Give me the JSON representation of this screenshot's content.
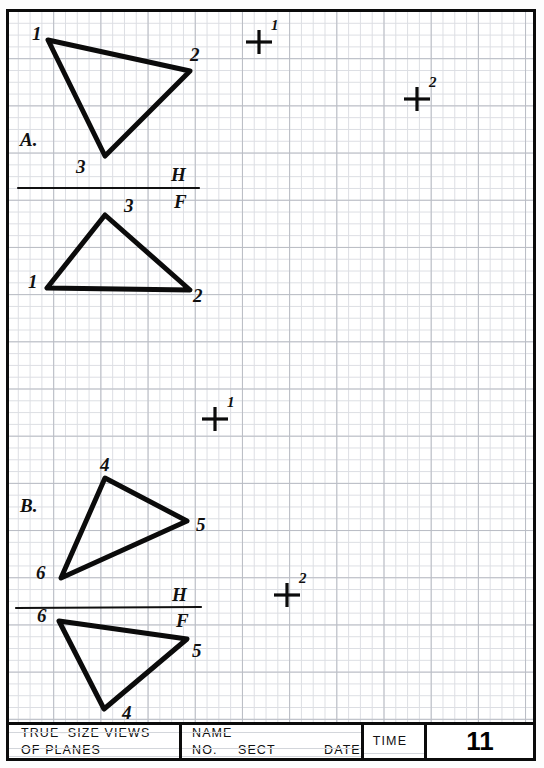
{
  "sheet": {
    "width": 544,
    "height": 768,
    "grid": {
      "minor_spacing_px": 11.8,
      "major_spacing_px": 47.2,
      "minor_color": "#dcdee3",
      "major_color": "#b9bcc4"
    },
    "ink_color": "#0b0b0b"
  },
  "problems": [
    {
      "id": "A",
      "section_label": "A.",
      "section_label_pos": {
        "x": 20,
        "y": 130
      },
      "top_view": {
        "name": "triangle-a-top-view",
        "points": [
          [
            48,
            40
          ],
          [
            190,
            71
          ],
          [
            105,
            156
          ]
        ],
        "vertex_labels": [
          {
            "text": "1",
            "x": 32,
            "y": 24
          },
          {
            "text": "2",
            "x": 190,
            "y": 45
          },
          {
            "text": "3",
            "x": 76,
            "y": 157
          }
        ]
      },
      "fold_line": {
        "name": "fold-line-a",
        "x1": 18,
        "y1": 188,
        "x2": 199,
        "y2": 188,
        "upper_label": {
          "text": "H",
          "x": 171,
          "y": 165
        },
        "lower_label": {
          "text": "F",
          "x": 174,
          "y": 192
        }
      },
      "front_view": {
        "name": "triangle-a-front-view",
        "points": [
          [
            105,
            215
          ],
          [
            47,
            288
          ],
          [
            190,
            290
          ]
        ],
        "vertex_labels": [
          {
            "text": "3",
            "x": 124,
            "y": 196
          },
          {
            "text": "1",
            "x": 28,
            "y": 272
          },
          {
            "text": "2",
            "x": 193,
            "y": 286
          }
        ]
      },
      "target_points": [
        {
          "name": "target-point-1",
          "text": "1",
          "x": 259,
          "y": 42
        },
        {
          "name": "target-point-2",
          "text": "2",
          "x": 417,
          "y": 99
        }
      ]
    },
    {
      "id": "B",
      "section_label": "B.",
      "section_label_pos": {
        "x": 20,
        "y": 496
      },
      "top_view": {
        "name": "triangle-b-top-view",
        "points": [
          [
            105,
            478
          ],
          [
            187,
            521
          ],
          [
            61,
            578
          ]
        ],
        "vertex_labels": [
          {
            "text": "4",
            "x": 100,
            "y": 455
          },
          {
            "text": "5",
            "x": 196,
            "y": 515
          },
          {
            "text": "6",
            "x": 36,
            "y": 563
          }
        ]
      },
      "fold_line": {
        "name": "fold-line-b",
        "x1": 16,
        "y1": 608,
        "x2": 201,
        "y2": 607,
        "upper_label": {
          "text": "H",
          "x": 172,
          "y": 585
        },
        "lower_label": {
          "text": "F",
          "x": 176,
          "y": 611
        }
      },
      "front_view": {
        "name": "triangle-b-front-view",
        "points": [
          [
            59,
            621
          ],
          [
            187,
            639
          ],
          [
            104,
            709
          ]
        ],
        "vertex_labels": [
          {
            "text": "6",
            "x": 37,
            "y": 606
          },
          {
            "text": "5",
            "x": 192,
            "y": 641
          },
          {
            "text": "4",
            "x": 122,
            "y": 703
          }
        ]
      },
      "target_points": [
        {
          "name": "target-point-1",
          "text": "1",
          "x": 215,
          "y": 419
        },
        {
          "name": "target-point-2",
          "text": "2",
          "x": 287,
          "y": 595
        }
      ]
    }
  ],
  "title_block": {
    "drawing_title_line1": "TRUE−SIZE  VIEWS",
    "drawing_title_line2": "OF  PLANES",
    "name_label": "NAME",
    "no_label": "NO.",
    "sect_label": "SECT",
    "date_label": "DATE",
    "time_label": "TIME",
    "sheet_number": "11"
  }
}
